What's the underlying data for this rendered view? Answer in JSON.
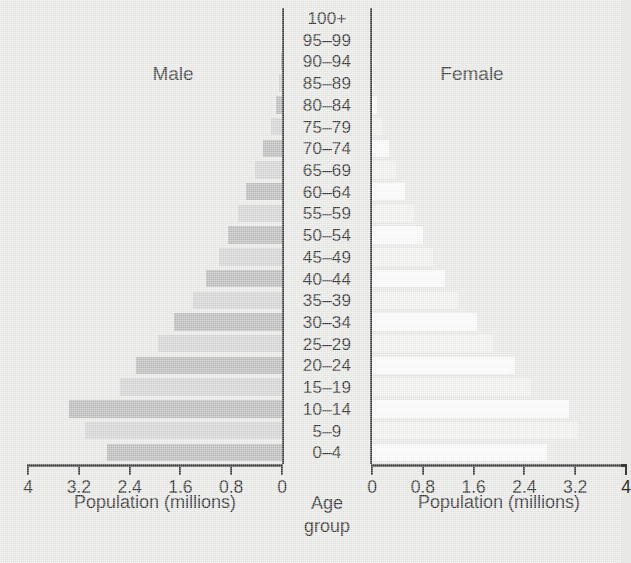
{
  "chart_data": {
    "type": "bar",
    "title": "",
    "subtitle": "",
    "orientation": "horizontal-pyramid",
    "categories": [
      "0–4",
      "5–9",
      "10–14",
      "15–19",
      "20–24",
      "25–29",
      "30–34",
      "35–39",
      "40–44",
      "45–49",
      "50–54",
      "55–59",
      "60–64",
      "65–69",
      "70–74",
      "75–79",
      "80–84",
      "85–89",
      "90–94",
      "95–99",
      "100+"
    ],
    "category_axis_label": "Age\ngroup",
    "series": [
      {
        "name": "Male",
        "side": "left",
        "color": "#b9b9b9",
        "values": [
          2.75,
          3.1,
          3.35,
          2.55,
          2.3,
          1.95,
          1.7,
          1.4,
          1.2,
          1.0,
          0.85,
          0.7,
          0.57,
          0.42,
          0.3,
          0.18,
          0.1,
          0.04,
          0.01,
          0.0,
          0.0
        ]
      },
      {
        "name": "Female",
        "side": "right",
        "color": "#fbfbfb",
        "values": [
          2.75,
          3.25,
          3.1,
          2.5,
          2.25,
          1.9,
          1.65,
          1.35,
          1.15,
          0.96,
          0.8,
          0.66,
          0.52,
          0.38,
          0.26,
          0.15,
          0.08,
          0.03,
          0.01,
          0.0,
          0.0
        ]
      }
    ],
    "xlabel": "Population (millions)",
    "ylabel": "Age group",
    "xlim": [
      0,
      4
    ],
    "xticks": [
      0,
      0.8,
      1.6,
      2.4,
      3.2,
      4
    ],
    "grid": false,
    "legend": "none"
  },
  "left_panel": {
    "title": "Male",
    "axis_title": "Population (millions)",
    "tick_labels": [
      "4",
      "3.2",
      "2.4",
      "1.6",
      "0.8",
      "0"
    ]
  },
  "right_panel": {
    "title": "Female",
    "axis_title": "Population (millions)",
    "tick_labels": [
      "0",
      "0.8",
      "1.6",
      "2.4",
      "3.2",
      "4"
    ]
  },
  "center_panel": {
    "title_line1": "Age",
    "title_line2": "group",
    "age_groups": [
      "100+",
      "95–99",
      "90–94",
      "85–89",
      "80–84",
      "75–79",
      "70–74",
      "65–69",
      "60–64",
      "55–59",
      "50–54",
      "45–49",
      "40–44",
      "35–39",
      "30–34",
      "25–29",
      "20–24",
      "15–19",
      "10–14",
      "5–9",
      "0–4"
    ]
  },
  "colors": {
    "background": "#e8e8e6",
    "male_bar": "#b9b9b9",
    "male_bar_alt": "#d2d2d2",
    "female_bar": "#fbfbfb",
    "female_bar_alt": "#f1f1f0",
    "axis": "#3c3c3c",
    "text": "#2f2f2f"
  }
}
